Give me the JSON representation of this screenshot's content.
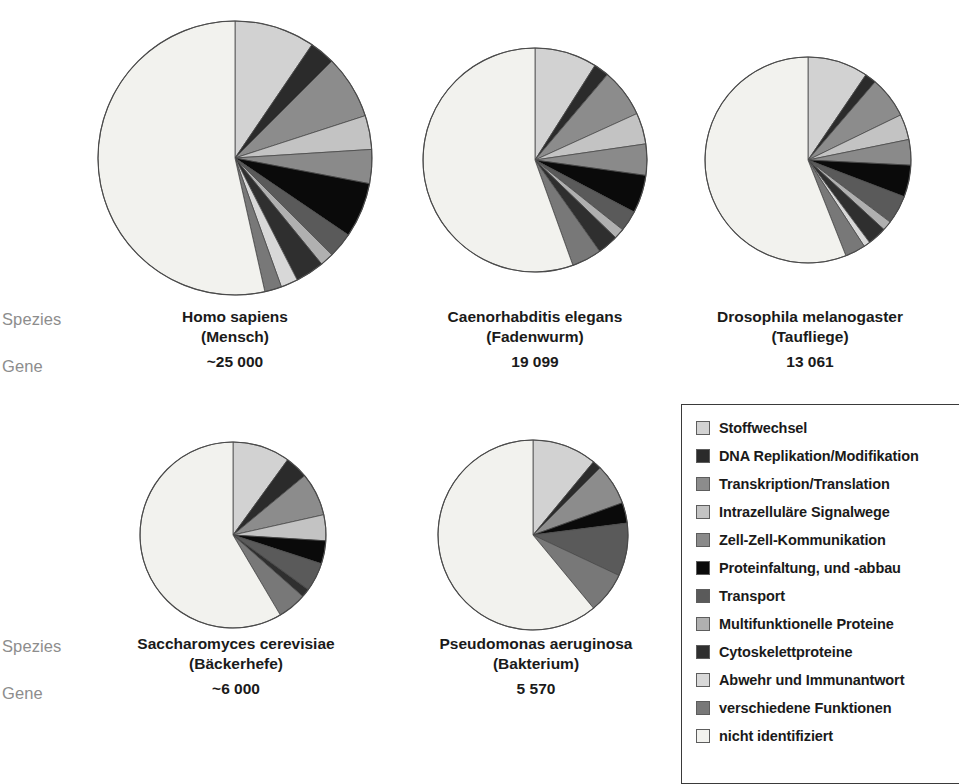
{
  "row_labels": {
    "species": "Spezies",
    "genes": "Gene"
  },
  "panels": [
    {
      "id": "homo-sapiens",
      "scientific_name": "Homo sapiens",
      "common_name": "(Mensch)",
      "gene_count": "~25 000",
      "cx": 235,
      "cy": 158,
      "r": 137,
      "values": [
        9.5,
        3.0,
        7.5,
        4.0,
        4.0,
        6.5,
        3.0,
        1.6,
        3.4,
        2.0,
        2.0,
        53.5
      ]
    },
    {
      "id": "caenorhabditis-elegans",
      "scientific_name": "Caenorhabditis elegans",
      "common_name": "(Fadenwurm)",
      "gene_count": "19 099",
      "cx": 535,
      "cy": 160,
      "r": 112,
      "values": [
        9.0,
        2.2,
        7.0,
        4.5,
        4.5,
        5.5,
        3.0,
        1.5,
        3.0,
        0.0,
        4.3,
        55.5
      ]
    },
    {
      "id": "drosophila-melanogaster",
      "scientific_name": "Drosophila melanogaster",
      "common_name": "(Taufliege)",
      "gene_count": "13 061",
      "cx": 808,
      "cy": 160,
      "r": 103,
      "values": [
        9.5,
        1.8,
        6.5,
        4.0,
        4.0,
        5.0,
        4.5,
        1.5,
        3.0,
        1.0,
        3.2,
        56.0
      ]
    },
    {
      "id": "saccharomyces-cerevisiae",
      "scientific_name": "Saccharomyces cerevisiae",
      "common_name": "(Bäckerhefe)",
      "gene_count": "~6 000",
      "cx": 233,
      "cy": 535,
      "r": 93,
      "values": [
        10.0,
        4.0,
        7.5,
        4.5,
        0.0,
        4.0,
        5.0,
        0.0,
        1.5,
        0.0,
        5.0,
        58.5
      ]
    },
    {
      "id": "pseudomonas-aeruginosa",
      "scientific_name": "Pseudomonas aeruginosa",
      "common_name": "(Bakterium)",
      "gene_count": "5 570",
      "cx": 533,
      "cy": 535,
      "r": 95,
      "values": [
        11.0,
        1.5,
        7.0,
        0.0,
        0.0,
        3.5,
        9.0,
        0.0,
        0.0,
        0.0,
        7.0,
        61.0
      ]
    }
  ],
  "legend": {
    "items": [
      {
        "label": "Stoffwechsel",
        "color": "#d2d2d2"
      },
      {
        "label": "DNA Replikation/Modifikation",
        "color": "#2b2b2b"
      },
      {
        "label": "Transkription/Translation",
        "color": "#8c8c8c"
      },
      {
        "label": "Intrazelluläre Signalwege",
        "color": "#c3c3c3"
      },
      {
        "label": "Zell-Zell-Kommunikation",
        "color": "#8a8a8a"
      },
      {
        "label": "Proteinfaltung, und -abbau",
        "color": "#0a0a0a"
      },
      {
        "label": "Transport",
        "color": "#5a5a5a"
      },
      {
        "label": "Multifunktionelle Proteine",
        "color": "#b0b0b0"
      },
      {
        "label": "Cytoskelettproteine",
        "color": "#2f2f2f"
      },
      {
        "label": "Abwehr und Immunantwort",
        "color": "#d8d8d8"
      },
      {
        "label": "verschiedene Funktionen",
        "color": "#787878"
      },
      {
        "label": "nicht identifiziert",
        "color": "#f2f2ee"
      }
    ]
  },
  "chart_data": {
    "type": "pie",
    "legend_position": "bottom-right",
    "categories": [
      "Stoffwechsel",
      "DNA Replikation/Modifikation",
      "Transkription/Translation",
      "Intrazelluläre Signalwege",
      "Zell-Zell-Kommunikation",
      "Proteinfaltung, und -abbau",
      "Transport",
      "Multifunktionelle Proteine",
      "Cytoskelettproteine",
      "Abwehr und Immunantwort",
      "verschiedene Funktionen",
      "nicht identifiziert"
    ],
    "colors": [
      "#d2d2d2",
      "#2b2b2b",
      "#8c8c8c",
      "#c3c3c3",
      "#8a8a8a",
      "#0a0a0a",
      "#5a5a5a",
      "#b0b0b0",
      "#2f2f2f",
      "#d8d8d8",
      "#787878",
      "#f2f2ee"
    ],
    "units": "percent",
    "series": [
      {
        "name": "Homo sapiens (Mensch)",
        "genes": "~25 000",
        "values": [
          9.5,
          3.0,
          7.5,
          4.0,
          4.0,
          6.5,
          3.0,
          1.6,
          3.4,
          2.0,
          2.0,
          53.5
        ]
      },
      {
        "name": "Caenorhabditis elegans (Fadenwurm)",
        "genes": "19 099",
        "values": [
          9.0,
          2.2,
          7.0,
          4.5,
          4.5,
          5.5,
          3.0,
          1.5,
          3.0,
          0.0,
          4.3,
          55.5
        ]
      },
      {
        "name": "Drosophila melanogaster (Taufliege)",
        "genes": "13 061",
        "values": [
          9.5,
          1.8,
          6.5,
          4.0,
          4.0,
          5.0,
          4.5,
          1.5,
          3.0,
          1.0,
          3.2,
          56.0
        ]
      },
      {
        "name": "Saccharomyces cerevisiae (Bäckerhefe)",
        "genes": "~6 000",
        "values": [
          10.0,
          4.0,
          7.5,
          4.5,
          0.0,
          4.0,
          5.0,
          0.0,
          1.5,
          0.0,
          5.0,
          58.5
        ]
      },
      {
        "name": "Pseudomonas aeruginosa (Bakterium)",
        "genes": "5 570",
        "values": [
          11.0,
          1.5,
          7.0,
          0.0,
          0.0,
          3.5,
          9.0,
          0.0,
          0.0,
          0.0,
          7.0,
          61.0
        ]
      }
    ]
  }
}
